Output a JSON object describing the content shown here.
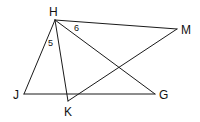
{
  "diagram": {
    "type": "geometry-figure",
    "points": {
      "H": {
        "label": "H",
        "x": 55,
        "y": 20
      },
      "M": {
        "label": "M",
        "x": 177,
        "y": 29
      },
      "J": {
        "label": "J",
        "x": 24,
        "y": 94
      },
      "K": {
        "label": "K",
        "x": 68,
        "y": 101
      },
      "G": {
        "label": "G",
        "x": 155,
        "y": 94
      }
    },
    "segments": [
      "HM",
      "HJ",
      "HK",
      "HG",
      "JG",
      "KM"
    ],
    "angle_labels": {
      "angle5": {
        "label": "5",
        "at": "H",
        "between": "HJ-HK"
      },
      "angle6": {
        "label": "6",
        "at": "H",
        "between": "HM-HG"
      }
    }
  }
}
